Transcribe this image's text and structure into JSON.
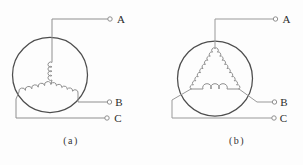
{
  "figure": {
    "left": {
      "caption": "(a)",
      "terminals": [
        {
          "label": "A"
        },
        {
          "label": "B"
        },
        {
          "label": "C"
        }
      ]
    },
    "right": {
      "caption": "(b)",
      "terminals": [
        {
          "label": "A"
        },
        {
          "label": "B"
        },
        {
          "label": "C"
        }
      ]
    },
    "colors": {
      "wire": "#999999",
      "coil": "#8f8f8f",
      "stator_outline": "#4d4d4d",
      "text": "#2b2b2b",
      "background": "#fdfdfd"
    }
  }
}
